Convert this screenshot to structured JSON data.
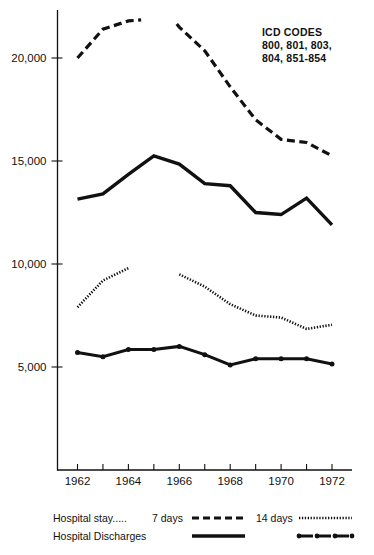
{
  "annotation": {
    "name": "icd-codes-note",
    "lines": [
      "ICD CODES",
      "800, 801, 803,",
      "804, 851-854"
    ]
  },
  "legend": {
    "row1_label": "Hospital stay.....",
    "row2_label": "Hospital Discharges",
    "col1_label": "7 days",
    "col2_label": "14 days",
    "sample_7day_stay_style": "dashed",
    "sample_14day_stay_style": "dotted",
    "sample_7day_discharge_style": "solid",
    "sample_14day_discharge_style": "dot-dash"
  },
  "chart_data": {
    "type": "line",
    "title": "",
    "xlabel": "",
    "ylabel": "",
    "xlim": [
      1961.4,
      1972.6
    ],
    "ylim": [
      4200,
      22400
    ],
    "ytick_values": [
      5000,
      10000,
      15000,
      20000
    ],
    "ytick_labels": [
      "5,000",
      "10,000",
      "15,000",
      "20,000"
    ],
    "xtick_values": [
      1962,
      1963,
      1964,
      1965,
      1966,
      1967,
      1968,
      1969,
      1970,
      1971,
      1972
    ],
    "xtick_labels": [
      "1962",
      "",
      "1964",
      "",
      "1966",
      "",
      "1968",
      "",
      "1970",
      "",
      "1972"
    ],
    "grid": false,
    "legend_position": "below-plot",
    "series": [
      {
        "name": "Hospital stay 7 days",
        "style": "dashed",
        "markers": false,
        "segments": [
          {
            "x": [
              1962,
              1963,
              1964,
              1964.5
            ],
            "values": [
              20000,
              21400,
              21800,
              21850
            ]
          },
          {
            "x": [
              1965.9,
              1966,
              1967,
              1968,
              1969,
              1970,
              1971,
              1972
            ],
            "values": [
              21650,
              21500,
              20350,
              18600,
              17000,
              16050,
              15900,
              15250
            ]
          }
        ]
      },
      {
        "name": "Hospital Discharges 7 days",
        "style": "solid",
        "markers": false,
        "segments": [
          {
            "x": [
              1962,
              1963,
              1964,
              1965,
              1966,
              1967,
              1968,
              1969,
              1970,
              1971,
              1972
            ],
            "values": [
              13150,
              13400,
              14350,
              15250,
              14850,
              13900,
              13800,
              12500,
              12400,
              13200,
              11900
            ]
          }
        ]
      },
      {
        "name": "Hospital stay 14 days",
        "style": "dotted",
        "markers": false,
        "segments": [
          {
            "x": [
              1962,
              1963,
              1964
            ],
            "values": [
              7900,
              9200,
              9800
            ]
          },
          {
            "x": [
              1966,
              1967,
              1968,
              1969,
              1970,
              1971,
              1972
            ],
            "values": [
              9500,
              8900,
              8050,
              7500,
              7400,
              6850,
              7050
            ]
          }
        ]
      },
      {
        "name": "Hospital Discharges 14 days",
        "style": "dot-dash",
        "markers": true,
        "segments": [
          {
            "x": [
              1962,
              1963,
              1964,
              1965,
              1966,
              1967,
              1968,
              1969,
              1970,
              1971,
              1972
            ],
            "values": [
              5700,
              5500,
              5850,
              5850,
              6000,
              5600,
              5100,
              5400,
              5400,
              5400,
              5150
            ]
          }
        ]
      }
    ]
  }
}
